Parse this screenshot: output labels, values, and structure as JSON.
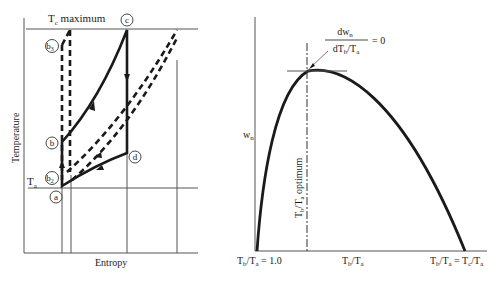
{
  "left_diagram": {
    "title": "Temperature–Entropy diagram",
    "y_axis_label": "Temperature",
    "x_axis_label": "Entropy",
    "tc_label": "T",
    "tc_sub": "c",
    "tc_suffix": " maximum",
    "ta_label": "T",
    "ta_sub": "a",
    "points": {
      "a": "a",
      "b": "b",
      "b2": "b",
      "b2_sub": "2",
      "b3": "b",
      "b3_sub": "3",
      "c": "c",
      "d": "d"
    }
  },
  "right_diagram": {
    "y_axis_label": "w",
    "y_axis_sub": "n",
    "x_axis_center_label": "T_b/T_a",
    "x_left_label": "T_b/T_a = 1.0",
    "x_right_label": "T_b/T_a = T_c/T_a",
    "optimum_label": "T_b/T_a optimum",
    "derivative_numerator": "dw",
    "derivative_numerator_sub": "n",
    "derivative_denominator": "dT_b/T_a",
    "derivative_equals": "= 0"
  },
  "colors": {
    "ink": "#1a1a1a",
    "thin_line": "#555555",
    "background": "#ffffff"
  }
}
